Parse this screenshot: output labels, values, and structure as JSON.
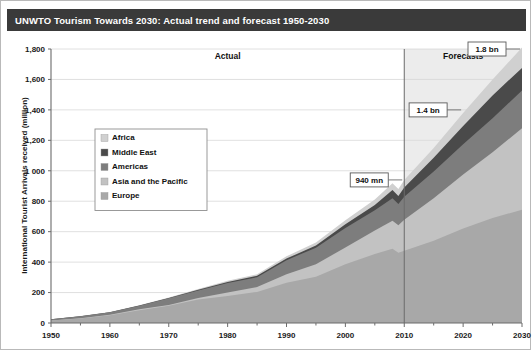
{
  "title": "UNWTO Tourism Towards 2030: Actual trend and forecast 1950-2030",
  "axes": {
    "ylabel": "International Tourist Arrivals received (million)",
    "yticks": [
      "0",
      "200",
      "400",
      "600",
      "800",
      "1 000",
      "1,200",
      "1,400",
      "1,600",
      "1,800"
    ],
    "xticks": [
      "1950",
      "1960",
      "1970",
      "1980",
      "1990",
      "2000",
      "2010",
      "2020",
      "2030"
    ]
  },
  "sections": {
    "actual_label": "Actual",
    "forecast_label": "Forecasts"
  },
  "callouts": [
    {
      "name": "callout-940mn",
      "label": "940 mn",
      "year": 2010,
      "value": 940
    },
    {
      "name": "callout-1-4bn",
      "label": "1.4 bn",
      "year": 2020,
      "value": 1400
    },
    {
      "name": "callout-1-8bn",
      "label": "1.8 bn",
      "year": 2030,
      "value": 1800
    }
  ],
  "legend": {
    "items": [
      {
        "label": "Africa",
        "color": "#d0d0d0"
      },
      {
        "label": "Middle East",
        "color": "#4a4a4a"
      },
      {
        "label": "Americas",
        "color": "#7d7d7d"
      },
      {
        "label": "Asia and the Pacific",
        "color": "#c2c2c2"
      },
      {
        "label": "Europe",
        "color": "#a8a8a8"
      }
    ]
  },
  "colors": {
    "title_bar": "#3a3a3a",
    "title_text": "#ffffff",
    "forecast_shade": "#ececec",
    "grid": "#d8d8d8",
    "axis": "#6b6b6b",
    "divider": "#6b6b6b"
  },
  "chart_data": {
    "type": "area",
    "stacked": true,
    "title": "UNWTO Tourism Towards 2030: Actual trend and forecast 1950-2030",
    "xlabel": "",
    "ylabel": "International Tourist Arrivals received (million)",
    "xlim": [
      1950,
      2030
    ],
    "ylim": [
      0,
      1800
    ],
    "grid": true,
    "legend_position": "inside-left",
    "forecast_start_year": 2010,
    "x": [
      1950,
      1955,
      1960,
      1965,
      1970,
      1975,
      1980,
      1985,
      1990,
      1995,
      2000,
      2005,
      2008,
      2009,
      2010,
      2015,
      2020,
      2025,
      2030
    ],
    "series": [
      {
        "name": "Europe",
        "color": "#a8a8a8",
        "values": [
          16,
          30,
          51,
          84,
          113,
          154,
          178,
          204,
          265,
          304,
          386,
          453,
          487,
          461,
          475,
          540,
          620,
          690,
          744
        ]
      },
      {
        "name": "Asia and the Pacific",
        "color": "#c2c2c2",
        "values": [
          0.2,
          1,
          3,
          6,
          6,
          10,
          23,
          32,
          56,
          82,
          110,
          154,
          184,
          181,
          204,
          280,
          355,
          432,
          535
        ]
      },
      {
        "name": "Americas",
        "color": "#7d7d7d",
        "values": [
          8,
          13,
          16,
          23,
          43,
          50,
          62,
          65,
          92,
          109,
          128,
          133,
          148,
          140,
          150,
          175,
          199,
          223,
          248
        ]
      },
      {
        "name": "Middle East",
        "color": "#4a4a4a",
        "values": [
          0.2,
          0.6,
          1,
          2,
          2,
          5,
          7,
          9,
          10,
          14,
          25,
          36,
          55,
          53,
          61,
          90,
          120,
          150,
          149
        ]
      },
      {
        "name": "Africa",
        "color": "#d0d0d0",
        "values": [
          0.5,
          0.8,
          1,
          1.5,
          3,
          5,
          7,
          10,
          15,
          20,
          26,
          35,
          44,
          46,
          50,
          64,
          85,
          105,
          134
        ]
      }
    ],
    "totals": [
      25,
      45,
      72,
      116,
      167,
      224,
      277,
      320,
      438,
      529,
      675,
      811,
      918,
      881,
      940,
      1149,
      1379,
      1600,
      1810
    ],
    "annotations": [
      {
        "text": "940 mn",
        "year": 2010
      },
      {
        "text": "1.4 bn",
        "year": 2020
      },
      {
        "text": "1.8 bn",
        "year": 2030
      },
      {
        "text": "Actual",
        "region": "1950-2010"
      },
      {
        "text": "Forecasts",
        "region": "2010-2030"
      }
    ]
  }
}
